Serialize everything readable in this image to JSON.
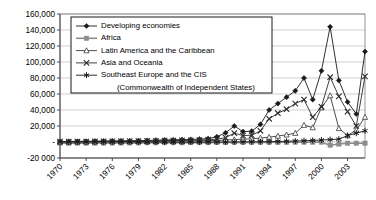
{
  "chart_data": {
    "type": "line",
    "title": "",
    "xlabel": "",
    "ylabel": "",
    "grid": "horizontal",
    "legend_position": "top-left-inside",
    "ylim": [
      -20000,
      160000
    ],
    "ytick_labels": [
      "160,000",
      "140,000",
      "120,000",
      "100,000",
      "80,000",
      "60,000",
      "40,000",
      "20,000",
      "-",
      "-20 000"
    ],
    "ytick_values": [
      160000,
      140000,
      120000,
      100000,
      80000,
      60000,
      40000,
      20000,
      0,
      -20000
    ],
    "xtick_labels": [
      "1970",
      "1973",
      "1976",
      "1979",
      "1982",
      "1985",
      "1988",
      "1991",
      "1994",
      "1997",
      "2000",
      "2003"
    ],
    "xtick_values": [
      1970,
      1973,
      1976,
      1979,
      1982,
      1985,
      1988,
      1991,
      1994,
      1997,
      2000,
      2003
    ],
    "x": [
      1970,
      1971,
      1972,
      1973,
      1974,
      1975,
      1976,
      1977,
      1978,
      1979,
      1980,
      1981,
      1982,
      1983,
      1984,
      1985,
      1986,
      1987,
      1988,
      1989,
      1990,
      1991,
      1992,
      1993,
      1994,
      1995,
      1996,
      1997,
      1998,
      1999,
      2000,
      2001,
      2002,
      2003,
      2004,
      2005
    ],
    "xlim": [
      1970,
      2005
    ],
    "series": [
      {
        "name": "Developing economies",
        "marker": "diamond",
        "color": "#1a1a1a",
        "values": [
          600,
          700,
          800,
          900,
          1000,
          1200,
          1300,
          1400,
          1500,
          1800,
          2000,
          2300,
          2600,
          2800,
          3000,
          3200,
          3600,
          4200,
          6500,
          11500,
          20000,
          13000,
          13500,
          22000,
          40000,
          48000,
          56000,
          64000,
          80000,
          53000,
          89000,
          144000,
          77000,
          50000,
          35000,
          113000
        ]
      },
      {
        "name": "Africa",
        "marker": "square",
        "color": "#8c8c8c",
        "values": [
          -1500,
          -1500,
          -1400,
          -1400,
          -1300,
          -1300,
          -1200,
          -1200,
          -1100,
          -1100,
          -1000,
          -1000,
          -900,
          -900,
          -900,
          -800,
          -800,
          -800,
          -700,
          -700,
          -600,
          -600,
          -600,
          -500,
          -500,
          -400,
          -400,
          -300,
          -300,
          -200,
          -200,
          -4000,
          -2500,
          -1500,
          -1500,
          -1500
        ]
      },
      {
        "name": "Latin America and the Caribbean",
        "marker": "triangle",
        "color": "#3a3a3a",
        "values": [
          200,
          200,
          300,
          300,
          400,
          400,
          500,
          500,
          600,
          700,
          800,
          900,
          1000,
          1100,
          1200,
          1300,
          1500,
          1700,
          2000,
          2500,
          3000,
          3500,
          4000,
          5000,
          6000,
          7500,
          9000,
          11000,
          21000,
          18000,
          43000,
          58000,
          17000,
          8000,
          15000,
          31000
        ]
      },
      {
        "name": "Asia and Oceania",
        "marker": "x",
        "color": "#2a2a2a",
        "values": [
          400,
          500,
          500,
          600,
          700,
          800,
          900,
          1000,
          1100,
          1200,
          1300,
          1500,
          1700,
          1800,
          2000,
          2200,
          2500,
          2900,
          3500,
          5500,
          11000,
          8000,
          8500,
          14000,
          29000,
          36000,
          41000,
          48000,
          53000,
          31000,
          44000,
          81000,
          57000,
          38000,
          20000,
          82000
        ]
      },
      {
        "name": "Southeast Europe and the CIS (Commonwealth of Independent States)",
        "legend_line_1": "Southeast Europe and the CIS",
        "legend_line_2": "(Commonwealth of Independent States)",
        "marker": "asterisk",
        "color": "#1a1a1a",
        "values": [
          0,
          0,
          0,
          0,
          0,
          0,
          0,
          0,
          0,
          0,
          0,
          0,
          0,
          0,
          0,
          0,
          0,
          0,
          0,
          0,
          100,
          200,
          300,
          400,
          500,
          700,
          900,
          1200,
          1600,
          2000,
          2500,
          3000,
          3500,
          8000,
          11000,
          14000
        ]
      }
    ]
  },
  "axes": {
    "plot_left": 60,
    "plot_right": 365,
    "plot_top": 14,
    "plot_bottom": 158
  }
}
